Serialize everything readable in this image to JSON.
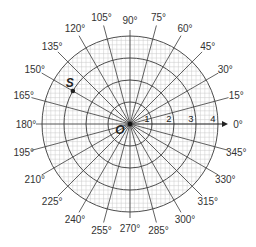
{
  "diagram": {
    "type": "polar-coordinate-grid",
    "center": {
      "x": 130,
      "y": 124
    },
    "unit_px": 22,
    "rings": [
      1,
      2,
      3,
      4
    ],
    "radial_step_deg": 15,
    "angle_labels": [
      "0°",
      "15°",
      "30°",
      "45°",
      "60°",
      "75°",
      "90°",
      "105°",
      "120°",
      "135°",
      "150°",
      "165°",
      "180°",
      "195°",
      "210°",
      "225°",
      "240°",
      "255°",
      "270°",
      "285°",
      "300°",
      "315°",
      "330°",
      "345°"
    ],
    "radius_labels": [
      "1",
      "2",
      "3",
      "4"
    ],
    "origin_label": "O",
    "points": [
      {
        "label": "S",
        "r": 3,
        "theta_deg": 150
      }
    ],
    "colors": {
      "major_line": "#3a3a3a",
      "minor_grid": "#c8c8c8",
      "text": "#333333"
    }
  }
}
